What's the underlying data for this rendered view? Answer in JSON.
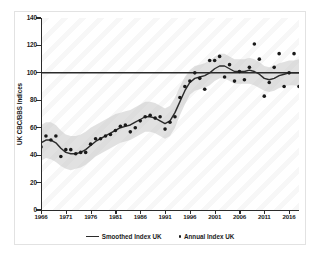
{
  "chart_data": {
    "type": "line",
    "title": "",
    "subtitle": "",
    "xlabel": "",
    "ylabel": "UK CBC/BBS Indices",
    "xlim": [
      1966,
      2018
    ],
    "ylim": [
      0,
      140
    ],
    "grid": false,
    "legend_position": "bottom-center",
    "x_ticks": [
      "1966",
      "1971",
      "1976",
      "1981",
      "1986",
      "1991",
      "1996",
      "2001",
      "2006",
      "2011",
      "2016"
    ],
    "x_tick_values": [
      1966,
      1971,
      1976,
      1981,
      1986,
      1991,
      1996,
      2001,
      2006,
      2011,
      2016
    ],
    "y_ticks": [
      "0",
      "20",
      "40",
      "60",
      "80",
      "100",
      "120",
      "140"
    ],
    "y_tick_values": [
      0,
      20,
      40,
      60,
      80,
      100,
      120,
      140
    ],
    "reference_line": {
      "value": 100,
      "label": "",
      "color": "#2b2b2b"
    },
    "annotations": [],
    "x": [
      1966,
      1967,
      1968,
      1969,
      1970,
      1971,
      1972,
      1973,
      1974,
      1975,
      1976,
      1977,
      1978,
      1979,
      1980,
      1981,
      1982,
      1983,
      1984,
      1985,
      1986,
      1987,
      1988,
      1989,
      1990,
      1991,
      1992,
      1993,
      1994,
      1995,
      1996,
      1997,
      1998,
      1999,
      2000,
      2001,
      2002,
      2003,
      2004,
      2005,
      2006,
      2007,
      2008,
      2009,
      2010,
      2011,
      2012,
      2013,
      2014,
      2015,
      2016,
      2017,
      2018
    ],
    "series": [
      {
        "name": "Annual Index UK",
        "type": "scatter",
        "marker": "circle",
        "color": "#1a1a1a",
        "values": [
          46,
          54,
          51,
          54,
          39,
          44,
          44,
          41,
          42,
          42,
          48,
          52,
          52,
          54,
          55,
          58,
          61,
          62,
          57,
          60,
          65,
          68,
          69,
          67,
          68,
          59,
          64,
          68,
          82,
          90,
          94,
          100,
          96,
          88,
          109,
          109,
          112,
          97,
          106,
          94,
          101,
          95,
          104,
          121,
          110,
          83,
          93,
          104,
          114,
          90,
          100,
          114,
          90
        ]
      },
      {
        "name": "Smoothed Index UK",
        "type": "line",
        "color": "#2b2b2b",
        "values": [
          49,
          51,
          51,
          49,
          45,
          42,
          41,
          41,
          42,
          44,
          47,
          50,
          52,
          54,
          56,
          58,
          60,
          61,
          62,
          64,
          66,
          68,
          68,
          67,
          65,
          63,
          65,
          71,
          79,
          87,
          93,
          96,
          97,
          98,
          100,
          103,
          105,
          105,
          103,
          101,
          101,
          101,
          102,
          101,
          99,
          96,
          95,
          96,
          98,
          99,
          100,
          100,
          100
        ]
      }
    ],
    "confidence_band": {
      "name": "confidence interval",
      "color": "#c9c9c9",
      "opacity": 0.55,
      "lower": [
        36,
        38,
        37,
        35,
        32,
        30,
        29,
        30,
        31,
        33,
        36,
        39,
        41,
        43,
        45,
        47,
        49,
        50,
        51,
        53,
        55,
        57,
        57,
        56,
        54,
        52,
        54,
        60,
        69,
        77,
        84,
        87,
        88,
        89,
        91,
        94,
        96,
        96,
        94,
        92,
        92,
        92,
        92,
        91,
        89,
        87,
        86,
        87,
        89,
        90,
        91,
        91,
        90
      ],
      "upper": [
        62,
        64,
        64,
        62,
        58,
        55,
        54,
        54,
        55,
        57,
        60,
        62,
        64,
        66,
        68,
        70,
        71,
        72,
        73,
        75,
        77,
        79,
        79,
        78,
        76,
        74,
        76,
        82,
        90,
        97,
        102,
        105,
        106,
        107,
        109,
        112,
        114,
        114,
        112,
        110,
        110,
        110,
        111,
        110,
        108,
        105,
        104,
        105,
        107,
        108,
        109,
        109,
        110
      ]
    }
  },
  "legend": {
    "entries": [
      {
        "label": "Smoothed Index UK",
        "marker": "line"
      },
      {
        "label": "Annual Index UK",
        "marker": "dot"
      }
    ]
  }
}
